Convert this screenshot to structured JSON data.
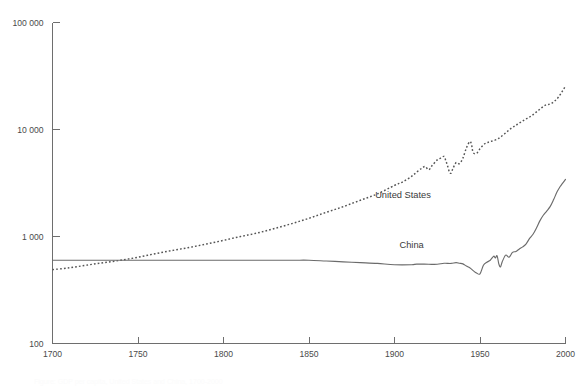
{
  "chart_data": {
    "type": "line",
    "title": "",
    "subtitle": "",
    "xlabel": "",
    "ylabel": "",
    "yscale": "log",
    "xlim": [
      1700,
      2000
    ],
    "ylim": [
      100,
      100000
    ],
    "grid": false,
    "legend_position": "inline-annotation",
    "x_ticks": [
      "1700",
      "1750",
      "1800",
      "1850",
      "1900",
      "1950",
      "2000"
    ],
    "x_tick_values": [
      1700,
      1750,
      1800,
      1850,
      1900,
      1950,
      2000
    ],
    "y_ticks": [
      "100",
      "1 000",
      "10 000",
      "100 000"
    ],
    "y_tick_values": [
      100,
      1000,
      10000,
      100000
    ],
    "annotations": [
      {
        "text": "United States",
        "x": 1905,
        "y": 2300
      },
      {
        "text": "China",
        "x": 1910,
        "y": 780
      }
    ],
    "series": [
      {
        "name": "United States",
        "style": "dotted",
        "color": "#555555",
        "label": "United States",
        "x": [
          1700,
          1710,
          1720,
          1730,
          1740,
          1750,
          1760,
          1770,
          1780,
          1790,
          1800,
          1810,
          1820,
          1830,
          1840,
          1850,
          1860,
          1870,
          1880,
          1890,
          1900,
          1905,
          1910,
          1913,
          1916,
          1918,
          1920,
          1922,
          1925,
          1927,
          1929,
          1930,
          1931,
          1932,
          1933,
          1934,
          1936,
          1938,
          1940,
          1942,
          1944,
          1945,
          1946,
          1948,
          1950,
          1953,
          1956,
          1960,
          1964,
          1968,
          1972,
          1976,
          1980,
          1984,
          1988,
          1992,
          1996,
          2000
        ],
        "values": [
          490,
          510,
          540,
          570,
          600,
          640,
          690,
          740,
          790,
          850,
          920,
          1000,
          1080,
          1190,
          1320,
          1480,
          1680,
          1900,
          2180,
          2500,
          3000,
          3250,
          3650,
          4000,
          4350,
          4500,
          4200,
          4600,
          5200,
          5400,
          5600,
          5100,
          4600,
          4050,
          3900,
          4250,
          4900,
          4800,
          5400,
          6700,
          7700,
          7300,
          6100,
          6000,
          6600,
          7400,
          7700,
          8100,
          9000,
          10200,
          11200,
          12300,
          13400,
          15000,
          16800,
          17600,
          20200,
          25500
        ]
      },
      {
        "name": "China",
        "style": "solid",
        "color": "#6b6b6b",
        "label": "China",
        "x": [
          1700,
          1720,
          1740,
          1760,
          1780,
          1800,
          1820,
          1840,
          1850,
          1860,
          1870,
          1880,
          1890,
          1900,
          1910,
          1913,
          1920,
          1925,
          1929,
          1933,
          1936,
          1938,
          1940,
          1942,
          1944,
          1946,
          1948,
          1950,
          1952,
          1954,
          1956,
          1958,
          1959,
          1960,
          1961,
          1962,
          1963,
          1965,
          1967,
          1969,
          1971,
          1973,
          1975,
          1977,
          1979,
          1981,
          1983,
          1985,
          1987,
          1989,
          1991,
          1993,
          1995,
          1997,
          1998,
          2000
        ],
        "values": [
          600,
          600,
          600,
          600,
          600,
          600,
          600,
          600,
          600,
          590,
          580,
          570,
          560,
          545,
          545,
          552,
          550,
          550,
          562,
          560,
          570,
          562,
          555,
          530,
          510,
          480,
          455,
          448,
          538,
          575,
          600,
          655,
          630,
          662,
          555,
          520,
          580,
          670,
          640,
          710,
          725,
          765,
          800,
          855,
          960,
          1050,
          1200,
          1400,
          1580,
          1730,
          1900,
          2200,
          2600,
          2950,
          3100,
          3420
        ]
      }
    ]
  },
  "caption": {
    "text": "Figure: GDP per capita, United States and China, 1700-2000"
  }
}
